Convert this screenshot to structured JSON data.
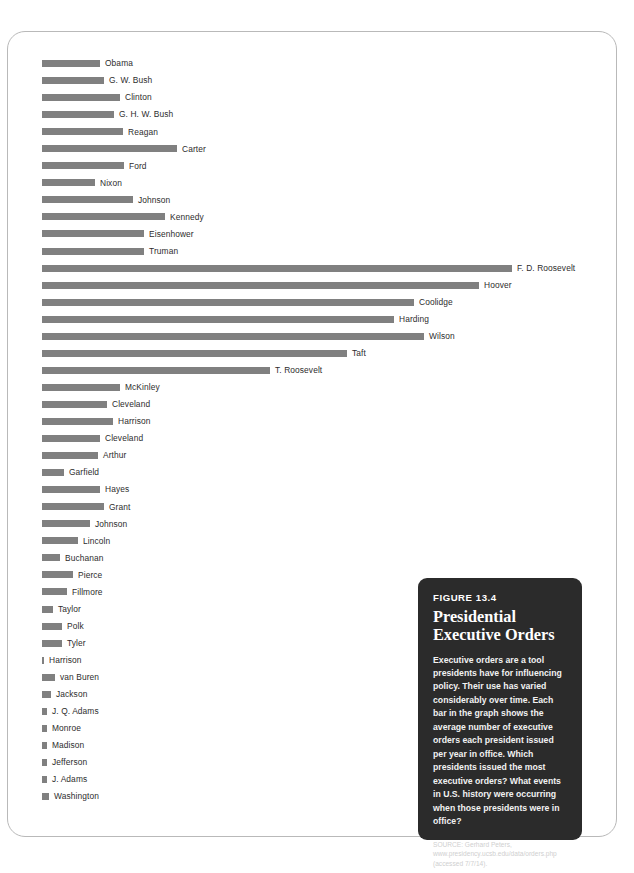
{
  "figure": {
    "number_label": "FIGURE 13.4",
    "title_line1": "Presidential",
    "title_line2": "Executive Orders",
    "body": "Executive orders are a tool presidents have for influencing policy. Their use has varied considerably over time. Each bar in the graph shows the average number of executive orders each president issued per year in office. Which presidents issued the most executive orders? What events in U.S. history were occurring when those presidents were in office?",
    "source": "SOURCE: Gerhard Peters, www.presidency.ucsb.edu/data/orders.php (accessed 7/7/14).",
    "box_color": "#2b2b2b",
    "text_color": "#ffffff"
  },
  "chart_data": {
    "type": "bar",
    "orientation": "horizontal",
    "title": "Presidential Executive Orders",
    "xlabel": "Average number of executive orders issued per year in office",
    "ylabel": "President",
    "grid": false,
    "legend": false,
    "bar_color": "#808080",
    "xlim": [
      0,
      310
    ],
    "categories": [
      "Obama",
      "G. W. Bush",
      "Clinton",
      "G. H. W. Bush",
      "Reagan",
      "Carter",
      "Ford",
      "Nixon",
      "Johnson",
      "Kennedy",
      "Eisenhower",
      "Truman",
      "F. D. Roosevelt",
      "Hoover",
      "Coolidge",
      "Harding",
      "Wilson",
      "Taft",
      "T. Roosevelt",
      "McKinley",
      "Cleveland",
      "Harrison",
      "Cleveland",
      "Arthur",
      "Garfield",
      "Hayes",
      "Grant",
      "Johnson",
      "Lincoln",
      "Buchanan",
      "Pierce",
      "Fillmore",
      "Taylor",
      "Polk",
      "Tyler",
      "Harrison",
      "van Buren",
      "Jackson",
      "J. Q. Adams",
      "Monroe",
      "Madison",
      "Jefferson",
      "J. Adams",
      "Washington"
    ],
    "values": [
      33,
      36,
      46,
      42,
      48,
      80,
      45,
      29,
      50,
      75,
      57,
      57,
      260,
      242,
      215,
      195,
      231,
      167,
      125,
      44,
      36,
      40,
      32,
      31,
      12,
      33,
      35,
      27,
      20,
      10,
      17,
      14,
      6,
      11,
      11,
      1,
      7,
      5,
      3,
      3,
      3,
      3,
      3,
      4
    ],
    "bar_pixel_lengths": [
      58,
      62,
      78,
      72,
      81,
      135,
      82,
      53,
      91,
      123,
      102,
      102,
      470,
      437,
      372,
      352,
      382,
      305,
      228,
      78,
      65,
      71,
      58,
      56,
      22,
      58,
      62,
      48,
      36,
      18,
      31,
      25,
      11,
      20,
      20,
      2,
      13,
      9,
      5,
      5,
      5,
      5,
      5,
      7
    ]
  }
}
